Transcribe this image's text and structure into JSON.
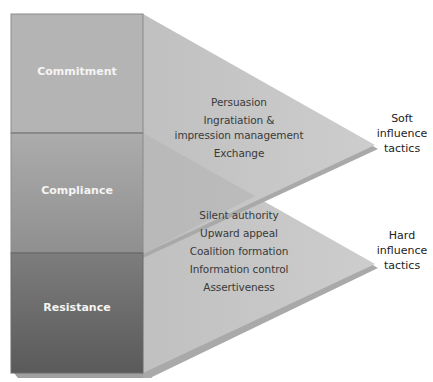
{
  "levels": [
    {
      "label": "Commitment"
    },
    {
      "label": "Compliance"
    },
    {
      "label": "Resistance"
    }
  ],
  "soft": {
    "title_line1": "Soft",
    "title_line2": "influence",
    "title_line3": "tactics",
    "tactics": [
      "Persuasion",
      "Ingratiation &",
      "impression management",
      "Exchange"
    ]
  },
  "hard": {
    "title_line1": "Hard",
    "title_line2": "influence",
    "title_line3": "tactics",
    "tactics": [
      "Silent authority",
      "Upward appeal",
      "Coalition formation",
      "Information control",
      "Assertiveness"
    ]
  },
  "colors": {
    "commitment": "#b3b3b3",
    "compliance_top": "#a9a9a9",
    "compliance_bottom": "#8e8e8e",
    "resistance_top": "#7a7a7a",
    "resistance_bottom": "#5c5c5c",
    "triangle": "#c4c4c4",
    "triangle_shadow": "#a8a8a8"
  }
}
